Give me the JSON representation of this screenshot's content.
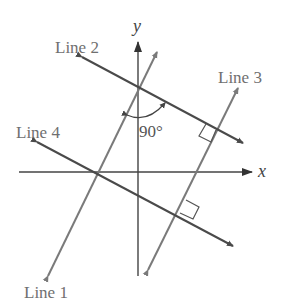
{
  "figure": {
    "axes": {
      "x_label": "x",
      "y_label": "y"
    },
    "lines": [
      {
        "name": "Line 1",
        "label": "Line 1",
        "color": "#7a7a7a"
      },
      {
        "name": "Line 2",
        "label": "Line 2",
        "color": "#555555"
      },
      {
        "name": "Line 3",
        "label": "Line 3",
        "color": "#7a7a7a"
      },
      {
        "name": "Line 4",
        "label": "Line 4",
        "color": "#555555"
      }
    ],
    "angle_label": "90°",
    "right_angle_markers": 2
  }
}
